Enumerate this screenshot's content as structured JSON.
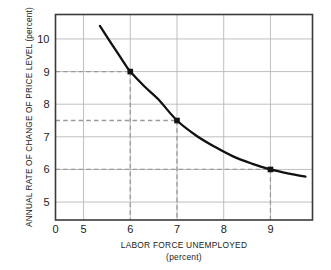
{
  "chart_data": {
    "type": "line",
    "title": "",
    "xlabel": "LABOR FORCE UNEMPLOYED",
    "xlabel_sub": "(percent)",
    "ylabel": "ANNUAL RATE OF CHANGE OF PRICE LEVEL (percent)",
    "xlim": [
      4.4,
      9.9
    ],
    "ylim": [
      4.45,
      10.75
    ],
    "grid": true,
    "legend": "none",
    "x_tick_labels": [
      "0",
      "5",
      "6",
      "7",
      "8",
      "9"
    ],
    "x_tick_values": [
      0,
      5,
      6,
      7,
      8,
      9
    ],
    "y_tick_labels": [
      "5",
      "6",
      "7",
      "8",
      "9",
      "10"
    ],
    "y_tick_values": [
      5,
      6,
      7,
      8,
      9,
      10
    ],
    "series": [
      {
        "name": "Phillips curve",
        "x": [
          5.35,
          5.6,
          5.9,
          6.0,
          6.3,
          6.6,
          7.0,
          7.4,
          7.8,
          8.2,
          8.6,
          9.0,
          9.4,
          9.75
        ],
        "y": [
          10.4,
          9.85,
          9.2,
          9.0,
          8.55,
          8.15,
          7.5,
          7.05,
          6.7,
          6.4,
          6.18,
          6.0,
          5.87,
          5.78
        ]
      }
    ],
    "markers": [
      {
        "x": 6.0,
        "y": 9.0,
        "label": "6, 9"
      },
      {
        "x": 7.0,
        "y": 7.5,
        "label": "7, 7.5"
      },
      {
        "x": 9.0,
        "y": 6.0,
        "label": "9, 6"
      }
    ],
    "guide_lines": [
      {
        "orientation": "horizontal",
        "value": 9.0
      },
      {
        "orientation": "horizontal",
        "value": 7.5
      },
      {
        "orientation": "horizontal",
        "value": 6.0
      },
      {
        "orientation": "vertical",
        "value": 6.0
      },
      {
        "orientation": "vertical",
        "value": 7.0
      },
      {
        "orientation": "vertical",
        "value": 9.0
      }
    ],
    "colors": {
      "curve": "#111111",
      "marker": "#111111",
      "grid": "#b8b8b8",
      "guide": "#9a9a9a",
      "axis": "#3a3a3a",
      "text": "#1a1a1a",
      "background": "#ffffff"
    }
  }
}
